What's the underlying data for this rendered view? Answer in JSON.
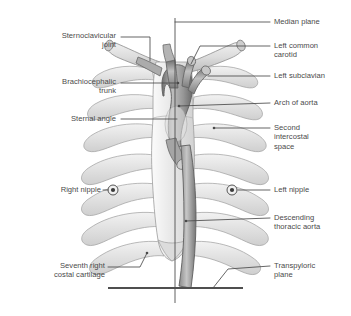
{
  "figure": {
    "colors": {
      "text": "#4a4a4a",
      "leader_line": "#4a4a4a",
      "bone_fill": "#e8e8e8",
      "bone_stroke": "#9a9a9a",
      "vessel_fill": "#b8b8b8",
      "vessel_stroke": "#6b6b6b",
      "plane_line": "#4f4f4f",
      "background": "#ffffff"
    },
    "reference_lines": [
      {
        "name": "median-plane",
        "orientation": "vertical",
        "x": 175,
        "y1": 18,
        "y2": 303
      },
      {
        "name": "transpyloric-plane",
        "orientation": "horizontal",
        "y": 288,
        "x1": 108,
        "x2": 243
      }
    ],
    "nipple_markers": [
      {
        "name": "right-nipple-marker",
        "cx": 113,
        "cy": 190
      },
      {
        "name": "left-nipple-marker",
        "cx": 232,
        "cy": 190
      }
    ]
  },
  "labels": {
    "left": [
      {
        "id": "sternoclavicular-joint",
        "text": "Sternoclavicular\njoint",
        "x": 16,
        "y": 33,
        "width": 100,
        "lines": 2
      },
      {
        "id": "brachiocephalic-trunk",
        "text": "Brachiocephalic\ntrunk",
        "x": 16,
        "y": 79,
        "width": 100,
        "lines": 2
      },
      {
        "id": "sternal-angle",
        "text": "Sternal angle",
        "x": 16,
        "y": 115,
        "width": 100,
        "lines": 1
      },
      {
        "id": "right-nipple",
        "text": "Right nipple",
        "x": 16,
        "y": 186,
        "width": 85,
        "lines": 1
      },
      {
        "id": "seventh-right-costal-cartilage",
        "text": "Seventh right\ncostal cartilage",
        "x": 10,
        "y": 262,
        "width": 95,
        "lines": 2
      }
    ],
    "right": [
      {
        "id": "median-plane",
        "text": "Median plane",
        "x": 274,
        "y": 19,
        "width": 76,
        "lines": 1
      },
      {
        "id": "left-common-carotid",
        "text": "Left common\ncarotid",
        "x": 274,
        "y": 42,
        "width": 76,
        "lines": 2
      },
      {
        "id": "left-subclavian",
        "text": "Left subclavian",
        "x": 274,
        "y": 72,
        "width": 76,
        "lines": 1
      },
      {
        "id": "arch-of-aorta",
        "text": "Arch of aorta",
        "x": 274,
        "y": 99,
        "width": 76,
        "lines": 1
      },
      {
        "id": "second-intercostal-space",
        "text": "Second\nintercostal\nspace",
        "x": 274,
        "y": 121,
        "width": 76,
        "lines": 3
      },
      {
        "id": "left-nipple",
        "text": "Left nipple",
        "x": 274,
        "y": 186,
        "width": 76,
        "lines": 1
      },
      {
        "id": "descending-thoracic-aorta",
        "text": "Descending\nthoracic aorta",
        "x": 274,
        "y": 213,
        "width": 76,
        "lines": 2
      },
      {
        "id": "transpyloric-plane",
        "text": "Transpyloric\nplane",
        "x": 274,
        "y": 262,
        "width": 76,
        "lines": 2
      }
    ]
  },
  "leaders": {
    "sternoclavicular-joint": {
      "path": "M121,37 L150,37 L150,61"
    },
    "brachiocephalic-trunk": {
      "path": "M121,83 L178,83",
      "dot": [
        178,
        83
      ]
    },
    "sternal-angle": {
      "path": "M121,119 L177,119"
    },
    "right-nipple": {
      "path": "M105,190 L108,190"
    },
    "seventh-right-costal-cartilage": {
      "path": "M110,267 L140,267 L146,254"
    },
    "median-plane": {
      "path": "M258,22 L270,22 M175,22 L258,22"
    },
    "left-common-carotid": {
      "path": "M258,46 L270,46 M196,46 L258,46 M196,46 L190,66"
    },
    "left-subclavian": {
      "path": "M258,76 L270,76 M206,76 L258,76"
    },
    "arch-of-aorta": {
      "path": "M258,103 L270,103 M178,107 L258,103",
      "dot": [
        178,
        107
      ]
    },
    "second-intercostal-space": {
      "path": "M258,128 L270,128 M213,128 L258,128",
      "dot": [
        213,
        128
      ]
    },
    "left-nipple": {
      "path": "M240,190 L270,190"
    },
    "descending-thoracic-aorta": {
      "path": "M258,218 L270,218 M185,221 L258,218",
      "dot": [
        185,
        221
      ]
    },
    "transpyloric-plane": {
      "path": "M258,266 L270,266 M213,288 L226,270 L258,266"
    }
  },
  "ribs": {
    "right_side": [
      {
        "index": 1,
        "y": 76
      },
      {
        "index": 2,
        "y": 104
      },
      {
        "index": 3,
        "y": 133
      },
      {
        "index": 4,
        "y": 163
      },
      {
        "index": 5,
        "y": 192
      },
      {
        "index": 6,
        "y": 221
      },
      {
        "index": 7,
        "y": 249
      }
    ],
    "left_side": [
      {
        "index": 1,
        "y": 76
      },
      {
        "index": 2,
        "y": 104
      },
      {
        "index": 3,
        "y": 133
      },
      {
        "index": 4,
        "y": 163
      },
      {
        "index": 5,
        "y": 192
      },
      {
        "index": 6,
        "y": 221
      },
      {
        "index": 7,
        "y": 249
      }
    ]
  }
}
